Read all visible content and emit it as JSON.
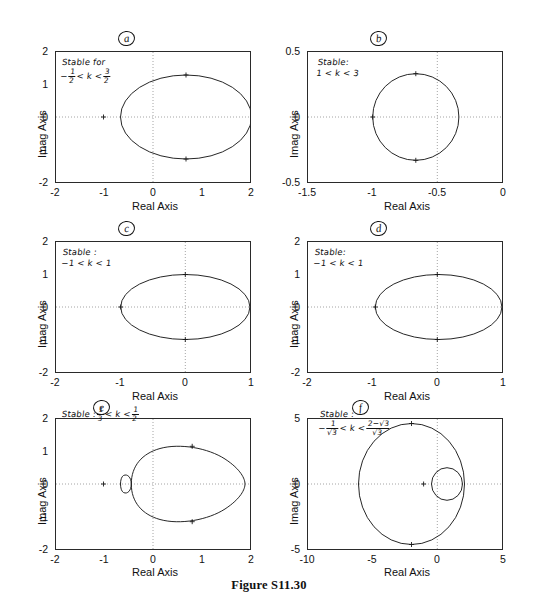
{
  "figure": {
    "caption": "Figure S11.30"
  },
  "axis_labels": {
    "x": "Real Axis",
    "y": "Imag Axis"
  },
  "panels": [
    {
      "letter": "a",
      "annotation_lines": [
        "Stable for",
        "-1/2 < k < 3/2"
      ],
      "annotation": {
        "line1": "Stable for",
        "line2_pre": "−",
        "line2_f1_num": "1",
        "line2_f1_den": "2",
        "line2_mid": "< k <",
        "line2_f2_num": "3",
        "line2_f2_den": "2"
      },
      "xticks": [
        "-2",
        "-1",
        "0",
        "1",
        "2"
      ],
      "yticks": [
        "2",
        "1",
        "0",
        "-1",
        "-2"
      ],
      "xlim": [
        -2,
        2
      ],
      "ylim": [
        -2,
        2
      ],
      "curves": [
        {
          "type": "ellipse",
          "cx": 0.68,
          "cy": 0,
          "rx": 1.35,
          "ry": 1.3
        }
      ],
      "markers": [
        {
          "x": -1.0,
          "y": 0.0,
          "glyph": "plus"
        },
        {
          "x": 0.68,
          "y": 1.3,
          "glyph": "plus"
        },
        {
          "x": 0.68,
          "y": -1.3,
          "glyph": "plus"
        }
      ]
    },
    {
      "letter": "b",
      "annotation_lines": [
        "Stable:",
        "1 < k < 3"
      ],
      "annotation": {
        "line1": "Stable:",
        "line2": "1 < k < 3"
      },
      "xticks": [
        "-1.5",
        "-1",
        "-0.5",
        "0"
      ],
      "yticks": [
        "0.5",
        "0",
        "-0.5"
      ],
      "xlim": [
        -1.5,
        0
      ],
      "ylim": [
        -0.5,
        0.5
      ],
      "curves": [
        {
          "type": "ellipse",
          "cx": -0.666,
          "cy": 0,
          "rx": 0.333,
          "ry": 0.333
        }
      ],
      "markers": [
        {
          "x": -1.0,
          "y": 0.0,
          "glyph": "plus"
        },
        {
          "x": -0.666,
          "y": 0.333,
          "glyph": "plus"
        },
        {
          "x": -0.666,
          "y": -0.333,
          "glyph": "plus"
        }
      ]
    },
    {
      "letter": "c",
      "annotation_lines": [
        "Stable :",
        "-1 < k < 1"
      ],
      "annotation": {
        "line1": "Stable :",
        "line2": "−1 < k < 1"
      },
      "xticks": [
        "-2",
        "-1",
        "0",
        "1"
      ],
      "yticks": [
        "2",
        "1",
        "0",
        "-1",
        "-2"
      ],
      "xlim": [
        -2,
        1
      ],
      "ylim": [
        -2,
        2
      ],
      "curves": [
        {
          "type": "ellipse",
          "cx": 0.0,
          "cy": 0,
          "rx": 1.0,
          "ry": 1.0
        }
      ],
      "markers": [
        {
          "x": -1.0,
          "y": 0.0,
          "glyph": "plus"
        },
        {
          "x": 0.0,
          "y": 1.0,
          "glyph": "plus"
        },
        {
          "x": 0.0,
          "y": -1.0,
          "glyph": "plus"
        }
      ]
    },
    {
      "letter": "d",
      "annotation_lines": [
        "Stable:",
        "-1 < k < 1"
      ],
      "annotation": {
        "line1": "Stable:",
        "line2": "−1 < k < 1"
      },
      "xticks": [
        "-2",
        "-1",
        "0",
        "1"
      ],
      "yticks": [
        "2",
        "1",
        "0",
        "-1",
        "-2"
      ],
      "xlim": [
        -2,
        1
      ],
      "ylim": [
        -2,
        2
      ],
      "curves": [
        {
          "type": "ellipse",
          "cx": 0.02,
          "cy": 0,
          "rx": 0.98,
          "ry": 1.0
        }
      ],
      "markers": [
        {
          "x": -0.96,
          "y": 0.0,
          "glyph": "plus"
        },
        {
          "x": 0.0,
          "y": 1.0,
          "glyph": "plus"
        },
        {
          "x": 0.0,
          "y": -1.0,
          "glyph": "plus"
        }
      ]
    },
    {
      "letter": "e",
      "annotation_lines": [
        "Stable : 1/3 < k < 1/2"
      ],
      "annotation": {
        "line1_pre": "Stable :",
        "f1_num": "1",
        "f1_den": "3",
        "mid": "< k <",
        "f2_num": "1",
        "f2_den": "2"
      },
      "xticks": [
        "-2",
        "-1",
        "0",
        "1",
        "2"
      ],
      "yticks": [
        "2",
        "1",
        "0",
        "-1",
        "-2"
      ],
      "xlim": [
        -2,
        2
      ],
      "ylim": [
        -2,
        2
      ],
      "curves": [
        {
          "type": "limacon",
          "note": "outer loop with small inner loop near -0.45"
        }
      ],
      "markers": [
        {
          "x": -1.0,
          "y": 0.0,
          "glyph": "plus"
        },
        {
          "x": 0.8,
          "y": 1.16,
          "glyph": "plus"
        },
        {
          "x": 0.8,
          "y": -1.16,
          "glyph": "plus"
        }
      ]
    },
    {
      "letter": "f",
      "annotation_lines": [
        "Stable :",
        "-1/√3 < k < (2-√3)/√3"
      ],
      "annotation": {
        "line1": "Stable :",
        "line2_pre": "−",
        "f1_num": "1",
        "f1_den": "√3",
        "mid": "< k <",
        "f2_num": "2−√3",
        "f2_den": "√3"
      },
      "xticks": [
        "-10",
        "-5",
        "0",
        "5"
      ],
      "yticks": [
        "5",
        "0",
        "-5"
      ],
      "xlim": [
        -10,
        5
      ],
      "ylim": [
        -5,
        5
      ],
      "curves": [
        {
          "type": "ellipse",
          "cx": -2.0,
          "cy": 0,
          "rx": 4.1,
          "ry": 4.65
        },
        {
          "type": "ellipse",
          "cx": 0.75,
          "cy": 0,
          "rx": 1.2,
          "ry": 1.25
        }
      ],
      "markers": [
        {
          "x": -1.1,
          "y": 0.0,
          "glyph": "plus"
        },
        {
          "x": -1.8,
          "y": 4.6,
          "glyph": "plus"
        },
        {
          "x": -1.8,
          "y": -4.6,
          "glyph": "plus"
        }
      ]
    }
  ]
}
